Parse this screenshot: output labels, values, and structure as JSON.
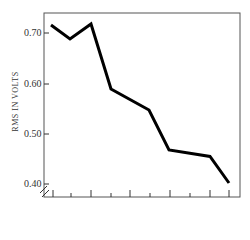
{
  "chart_data": {
    "type": "line",
    "title": "",
    "xlabel": "",
    "ylabel": "RMS IN VOLTS",
    "ylim": [
      0.4,
      0.73
    ],
    "yticks": [
      "0.70",
      "0.60",
      "0.50",
      "0.40"
    ],
    "x": [
      1,
      2,
      3,
      4,
      5,
      6,
      7,
      8
    ],
    "series": [
      {
        "name": "RMS",
        "values": [
          0.718,
          0.69,
          0.72,
          0.59,
          0.548,
          0.468,
          0.455,
          0.402
        ]
      }
    ],
    "grid": false,
    "legend": "none",
    "axis_break": true,
    "line_color": "#000000"
  },
  "axis": {
    "ylabel": "RMS IN VOLTS",
    "yticks": [
      {
        "label": "0.70",
        "y": 33
      },
      {
        "label": "0.60",
        "y": 84
      },
      {
        "label": "0.50",
        "y": 134
      },
      {
        "label": "0.40",
        "y": 184
      }
    ]
  }
}
